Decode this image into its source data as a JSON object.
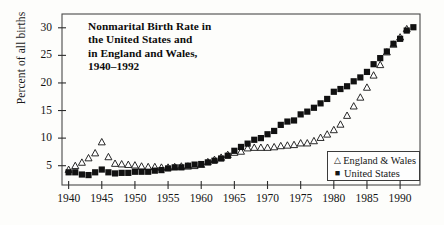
{
  "chart_data": {
    "type": "scatter",
    "title_lines": [
      "Nonmarital Birth Rate in",
      "the United States and",
      "in England and Wales,",
      "1940–1992"
    ],
    "xlabel": "",
    "ylabel": "Percent of all births",
    "xlim": [
      1939,
      1993
    ],
    "ylim": [
      1.5,
      32.5
    ],
    "grid": false,
    "legend_position": "lower-right",
    "xticks": [
      1940,
      1945,
      1950,
      1955,
      1960,
      1965,
      1970,
      1975,
      1980,
      1985,
      1990
    ],
    "xtick_labels": [
      "1940",
      "1945",
      "1950",
      "1955",
      "1960",
      "1965",
      "1970",
      "1975",
      "1980",
      "1985",
      "1990"
    ],
    "yticks": [
      5,
      10,
      15,
      20,
      25,
      30
    ],
    "ytick_labels": [
      "5",
      "10",
      "15",
      "20",
      "25",
      "30"
    ],
    "x": [
      1940,
      1941,
      1942,
      1943,
      1944,
      1945,
      1946,
      1947,
      1948,
      1949,
      1950,
      1951,
      1952,
      1953,
      1954,
      1955,
      1956,
      1957,
      1958,
      1959,
      1960,
      1961,
      1962,
      1963,
      1964,
      1965,
      1966,
      1967,
      1968,
      1969,
      1970,
      1971,
      1972,
      1973,
      1974,
      1975,
      1976,
      1977,
      1978,
      1979,
      1980,
      1981,
      1982,
      1983,
      1984,
      1985,
      1986,
      1987,
      1988,
      1989,
      1990,
      1991,
      1992
    ],
    "series": [
      {
        "name": "England & Wales",
        "marker": "open-triangle",
        "color": "#111111",
        "values": [
          4.3,
          5.0,
          5.6,
          6.4,
          7.3,
          9.3,
          6.6,
          5.4,
          5.3,
          5.2,
          5.1,
          4.9,
          4.8,
          4.8,
          4.7,
          4.7,
          4.8,
          4.9,
          4.9,
          5.0,
          5.2,
          5.7,
          6.1,
          6.5,
          7.0,
          7.4,
          7.6,
          8.2,
          8.3,
          8.3,
          8.3,
          8.4,
          8.6,
          8.7,
          8.8,
          9.1,
          9.1,
          9.5,
          10.1,
          10.7,
          11.5,
          12.5,
          14.1,
          15.8,
          17.4,
          19.2,
          21.4,
          23.3,
          25.6,
          27.0,
          28.3,
          29.8,
          null
        ]
      },
      {
        "name": "United States",
        "marker": "filled-square",
        "color": "#111111",
        "values": [
          3.8,
          3.8,
          3.4,
          3.3,
          3.8,
          4.3,
          3.8,
          3.6,
          3.7,
          3.7,
          3.9,
          3.9,
          3.9,
          4.1,
          4.2,
          4.5,
          4.7,
          4.7,
          5.0,
          5.2,
          5.3,
          5.6,
          5.9,
          6.3,
          6.8,
          7.7,
          8.4,
          9.0,
          9.7,
          10.0,
          10.7,
          11.3,
          12.4,
          13.0,
          13.2,
          14.3,
          14.8,
          15.5,
          16.3,
          17.1,
          18.4,
          18.9,
          19.4,
          20.3,
          21.0,
          22.0,
          23.4,
          24.5,
          25.7,
          27.1,
          28.0,
          29.5,
          30.1
        ]
      }
    ],
    "annotations": {
      "wwii_peak": {
        "series": "England & Wales",
        "year": 1945,
        "value": 9.3
      }
    }
  },
  "legend": {
    "items": [
      {
        "label": "England & Wales",
        "marker": "△"
      },
      {
        "label": "United States",
        "marker": "■"
      }
    ]
  }
}
